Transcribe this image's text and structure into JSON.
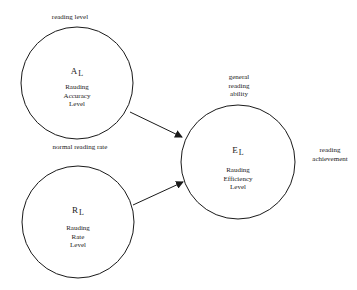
{
  "diagram": {
    "type": "path-model",
    "colors": {
      "stroke": "#1a1a1a",
      "background": "#ffffff"
    },
    "nodes": [
      {
        "id": "accuracy",
        "symbol": "A",
        "subscript": "L",
        "lines": [
          "Rauding",
          "Accuracy",
          "Level"
        ],
        "outer_label": "reading level"
      },
      {
        "id": "rate",
        "symbol": "R",
        "subscript": "L",
        "lines": [
          "Rauding",
          "Rate",
          "Level"
        ],
        "outer_label": "normal reading rate"
      },
      {
        "id": "efficiency",
        "symbol": "E",
        "subscript": "L",
        "lines": [
          "Rauding",
          "Efficiency",
          "Level"
        ],
        "outer_label_lines": [
          "general",
          "reading",
          "ability"
        ],
        "side_label_lines": [
          "reading",
          "achievement"
        ]
      }
    ],
    "edges": [
      {
        "from": "accuracy",
        "to": "efficiency"
      },
      {
        "from": "rate",
        "to": "efficiency"
      }
    ]
  }
}
